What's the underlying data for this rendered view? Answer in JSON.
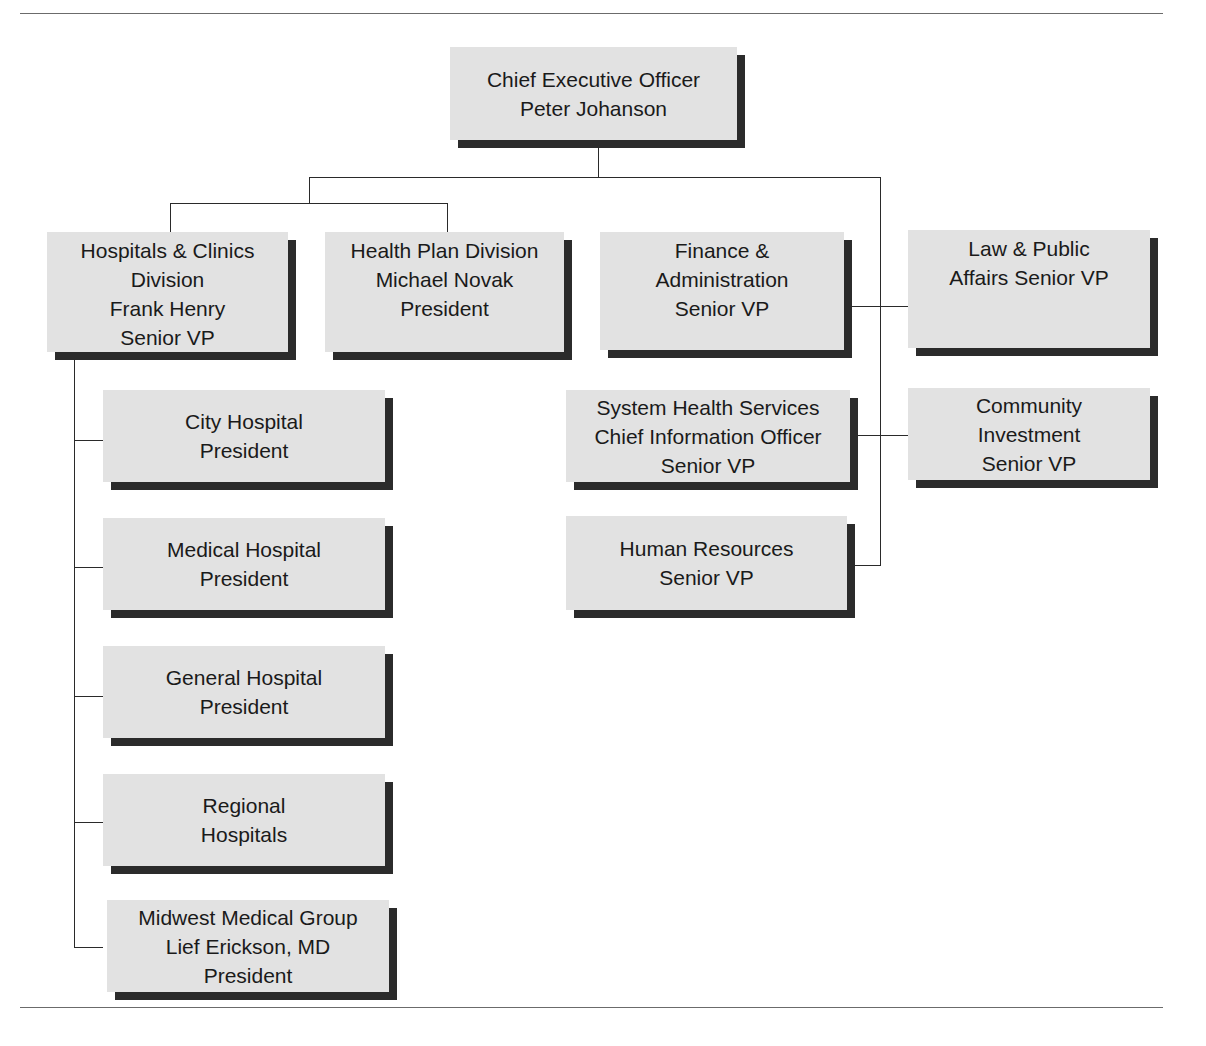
{
  "diagram": {
    "type": "org-chart",
    "root": {
      "id": "ceo",
      "lines": [
        "Chief Executive Officer",
        "Peter Johanson"
      ]
    },
    "divisions": [
      {
        "id": "hospitals-clinics",
        "lines": [
          "Hospitals & Clinics",
          "Division",
          "Frank Henry",
          "Senior VP"
        ]
      },
      {
        "id": "health-plan",
        "lines": [
          "Health Plan Division",
          "Michael Novak",
          "President"
        ]
      }
    ],
    "staff_left": [
      {
        "id": "finance-admin",
        "lines": [
          "Finance &",
          "Administration",
          "Senior VP"
        ]
      },
      {
        "id": "system-health",
        "lines": [
          "System Health Services",
          "Chief Information Officer",
          "Senior VP"
        ]
      },
      {
        "id": "human-resources",
        "lines": [
          "Human Resources",
          "Senior VP"
        ]
      }
    ],
    "staff_right": [
      {
        "id": "law-public-affairs",
        "lines": [
          "Law & Public",
          "Affairs Senior VP"
        ]
      },
      {
        "id": "community-investment",
        "lines": [
          "Community",
          "Investment",
          "Senior VP"
        ]
      }
    ],
    "hospital_units": [
      {
        "id": "city-hospital",
        "lines": [
          "City Hospital",
          "President"
        ]
      },
      {
        "id": "medical-hospital",
        "lines": [
          "Medical Hospital",
          "President"
        ]
      },
      {
        "id": "general-hospital",
        "lines": [
          "General Hospital",
          "President"
        ]
      },
      {
        "id": "regional-hospitals",
        "lines": [
          "Regional",
          "Hospitals"
        ]
      },
      {
        "id": "midwest-medical-group",
        "lines": [
          "Midwest Medical Group",
          "Lief Erickson, MD",
          "President"
        ]
      }
    ]
  },
  "colors": {
    "box_fill": "#e2e2e2",
    "box_shadow": "#2b2b2b",
    "line": "#2a2a2a",
    "rule": "#6b6b6b"
  }
}
